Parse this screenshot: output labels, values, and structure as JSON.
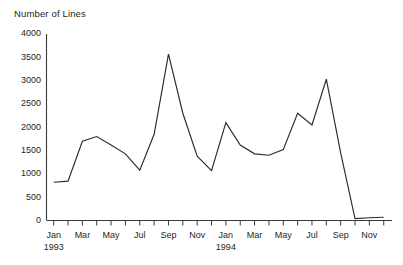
{
  "chart_data": {
    "type": "line",
    "title": "Number of Lines",
    "xlabel": "",
    "ylabel": "",
    "ylim": [
      0,
      4000
    ],
    "ytick_step": 500,
    "yticks": [
      0,
      500,
      1000,
      1500,
      2000,
      2500,
      3000,
      3500,
      4000
    ],
    "ytick_labels": [
      "0",
      "500",
      "1000",
      "1500",
      "2000",
      "2500",
      "3000",
      "3500",
      "4000"
    ],
    "grid": false,
    "legend": false,
    "line_color": "#2b2b2b",
    "axis_color": "#3a3a3a",
    "background": "#ffffff",
    "x": [
      "Jan 1993",
      "Feb 1993",
      "Mar 1993",
      "Apr 1993",
      "May 1993",
      "Jun 1993",
      "Jul 1993",
      "Aug 1993",
      "Sep 1993",
      "Oct 1993",
      "Nov 1993",
      "Dec 1993",
      "Jan 1994",
      "Feb 1994",
      "Mar 1994",
      "Apr 1994",
      "May 1994",
      "Jun 1994",
      "Jul 1994",
      "Aug 1994",
      "Sep 1994",
      "Oct 1994",
      "Nov 1994",
      "Dec 1994"
    ],
    "xtick_labels": [
      "Jan",
      "",
      "Mar",
      "",
      "May",
      "",
      "Jul",
      "",
      "Sep",
      "",
      "Nov",
      "",
      "Jan",
      "",
      "Mar",
      "",
      "May",
      "",
      "Jul",
      "",
      "Sep",
      "",
      "Nov",
      ""
    ],
    "year_labels": [
      {
        "text": "1993",
        "at_index": 0
      },
      {
        "text": "1994",
        "at_index": 12
      }
    ],
    "values": [
      820,
      845,
      1700,
      1800,
      1620,
      1430,
      1080,
      1850,
      3570,
      2300,
      1380,
      1070,
      2100,
      1620,
      1430,
      1400,
      1520,
      2300,
      2050,
      3030,
      1450,
      40,
      60,
      70
    ],
    "series": [
      {
        "name": "Number of Lines",
        "values": [
          820,
          845,
          1700,
          1800,
          1620,
          1430,
          1080,
          1850,
          3570,
          2300,
          1380,
          1070,
          2100,
          1620,
          1430,
          1400,
          1520,
          2300,
          2050,
          3030,
          1450,
          40,
          60,
          70
        ]
      }
    ]
  }
}
